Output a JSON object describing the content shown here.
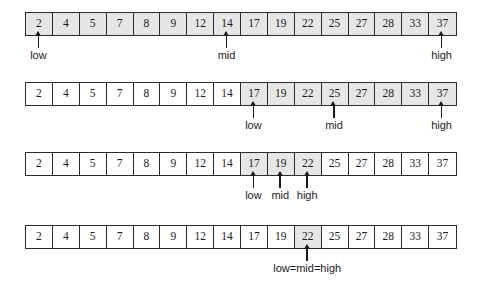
{
  "diagram": {
    "array_values": [
      "2",
      "4",
      "5",
      "7",
      "8",
      "9",
      "12",
      "14",
      "17",
      "19",
      "22",
      "25",
      "27",
      "28",
      "33",
      "37"
    ],
    "cell_count": 16,
    "colors": {
      "shaded_cell": "#e6e6e6",
      "unshaded_cell": "#ffffff",
      "border": "#2b2b2b",
      "text": "#1a1a1a",
      "background": "#ffffff"
    },
    "stages": [
      {
        "name": "stage-1",
        "top": 12,
        "shaded_from": 0,
        "shaded_to": 15,
        "markers": [
          {
            "label": "low",
            "index": 0,
            "offset": 0,
            "align": "center"
          },
          {
            "label": "mid",
            "index": 7,
            "offset": 0,
            "align": "center"
          },
          {
            "label": "high",
            "index": 15,
            "offset": 0,
            "align": "center"
          }
        ]
      },
      {
        "name": "stage-2",
        "top": 82,
        "shaded_from": 8,
        "shaded_to": 15,
        "markers": [
          {
            "label": "low",
            "index": 8,
            "offset": 0,
            "align": "center"
          },
          {
            "label": "mid",
            "index": 11,
            "offset": 0,
            "align": "center"
          },
          {
            "label": "high",
            "index": 15,
            "offset": 0,
            "align": "center"
          }
        ]
      },
      {
        "name": "stage-3",
        "top": 152,
        "shaded_from": 8,
        "shaded_to": 10,
        "markers": [
          {
            "label": "low",
            "index": 8,
            "offset": 0,
            "align": "center"
          },
          {
            "label": "mid",
            "index": 9,
            "offset": 0,
            "align": "center"
          },
          {
            "label": "high",
            "index": 10,
            "offset": 0,
            "align": "center"
          }
        ]
      },
      {
        "name": "stage-4",
        "top": 225,
        "shaded_from": 10,
        "shaded_to": 10,
        "markers": [
          {
            "label": "low=mid=high",
            "index": 10,
            "offset": 0,
            "align": "center"
          }
        ]
      }
    ]
  }
}
